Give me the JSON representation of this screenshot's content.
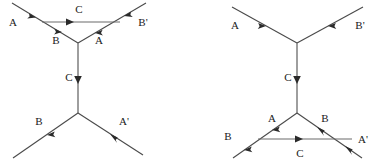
{
  "figure": {
    "kind": "feynman-diagrams",
    "count": 2,
    "line_color": "#4a4a4a",
    "text_color": "#1a1a1a",
    "background": "#ffffff"
  },
  "diagrams": [
    {
      "id": "left-diagram",
      "name": "s-channel-triangle-top",
      "labels": {
        "top_left_incoming": "A",
        "top_right_outgoing": "B'",
        "top_horizontal": "C",
        "upper_left_internal": "B",
        "upper_right_internal": "A",
        "vertical_propagator": "C",
        "bottom_left_incoming": "B",
        "bottom_right_outgoing": "A'"
      }
    },
    {
      "id": "right-diagram",
      "name": "s-channel-triangle-bottom",
      "labels": {
        "top_left_incoming": "A",
        "top_right_outgoing": "B'",
        "vertical_propagator": "C",
        "lower_left_internal": "A",
        "lower_right_internal": "B",
        "bottom_left_incoming": "B",
        "bottom_right_outgoing": "A'",
        "bottom_horizontal": "C"
      }
    }
  ]
}
